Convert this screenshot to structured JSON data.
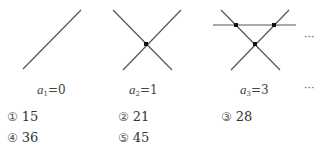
{
  "figures": [
    {
      "label_var": "a",
      "label_sub": "1",
      "label_eq": "=0",
      "lines": 1,
      "intersections": 0
    },
    {
      "label_var": "a",
      "label_sub": "2",
      "label_eq": "=1",
      "lines": 2,
      "intersections": 1
    },
    {
      "label_var": "a",
      "label_sub": "3",
      "label_eq": "=3",
      "lines": 3,
      "intersections": 3
    }
  ],
  "continuation": "···",
  "options": [
    {
      "marker": "①",
      "value": "15"
    },
    {
      "marker": "②",
      "value": "21"
    },
    {
      "marker": "③",
      "value": "28"
    },
    {
      "marker": "④",
      "value": "36"
    },
    {
      "marker": "⑤",
      "value": "45"
    }
  ]
}
